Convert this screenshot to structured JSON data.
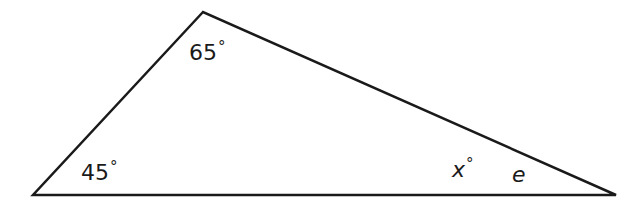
{
  "figure": {
    "type": "triangle",
    "stroke_color": "#1a1a1a",
    "vertices": {
      "top": [
        203,
        12
      ],
      "bottom_left": [
        33,
        195
      ],
      "bottom_right": [
        616,
        195
      ]
    }
  },
  "labels": {
    "top_angle": {
      "value": "65",
      "unit": "°"
    },
    "bottom_left_angle": {
      "value": "45",
      "unit": "°"
    },
    "bottom_right_angle": {
      "value": "x",
      "unit": "°"
    },
    "bottom_right_name": {
      "value": "e"
    }
  }
}
